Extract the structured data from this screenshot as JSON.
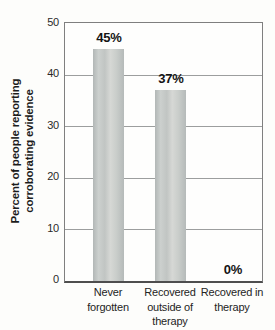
{
  "chart_data": {
    "type": "bar",
    "title": "",
    "categories": [
      "Never forgotten",
      "Recovered outside of therapy",
      "Recovered in therapy"
    ],
    "values": [
      45,
      37,
      0
    ],
    "value_labels": [
      "45%",
      "37%",
      "0%"
    ],
    "ylabel": "Percent of people reporting corroborating evidence",
    "ylabel_line1": "Percent of people reporting",
    "ylabel_line2": "corroborating evidence",
    "xlabel": "",
    "ylim": [
      0,
      50
    ],
    "yticks": [
      0,
      10,
      20,
      30,
      40,
      50
    ],
    "ytick_labels_top_to_bottom": [
      "50",
      "40",
      "30",
      "20",
      "10",
      "0"
    ],
    "grid": true,
    "legend": false,
    "colors": {
      "bar_edge": "#b4b9b8",
      "bar_center": "#d6d8d5",
      "gridline": "#9c9e9e",
      "frame": "#7f7f7f",
      "axis_line": "#4e4e4e",
      "text": "#1c1c1c",
      "background": "#fdfdfb"
    }
  }
}
